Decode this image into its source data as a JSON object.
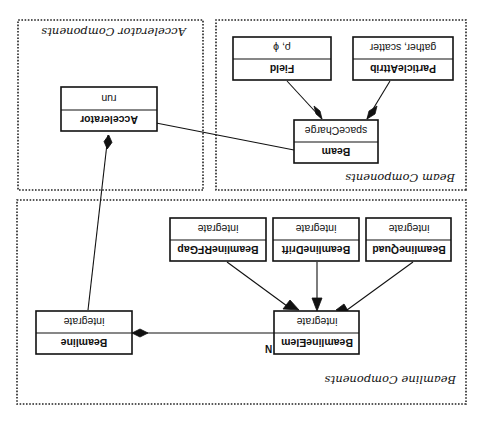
{
  "orientation": "rotated-180",
  "frames": {
    "accelerator": {
      "label": "Accelerator Components"
    },
    "beam": {
      "label": "Beam Components"
    },
    "beamline": {
      "label": "Beamline Components"
    }
  },
  "classes": {
    "accelerator": {
      "name": "Accelerator",
      "operation": "run"
    },
    "beam": {
      "name": "Beam",
      "operation": "spaceCharge"
    },
    "field": {
      "name": "Field",
      "operation": "ρ, ϕ"
    },
    "particle_attrib": {
      "name": "ParticleAttrib",
      "operation": "gather, scatter"
    },
    "beamline": {
      "name": "Beamline",
      "operation": "integrate"
    },
    "beamline_elem": {
      "name": "BeamlineElem",
      "operation": "integrate"
    },
    "beamline_quad": {
      "name": "BeamlineQuad",
      "operation": "integrate"
    },
    "beamline_drift": {
      "name": "BeamlineDrift",
      "operation": "integrate"
    },
    "beamline_rfgap": {
      "name": "BeamlineRFGap",
      "operation": "integrate"
    }
  },
  "relations": [
    {
      "type": "composition",
      "from": "Beam",
      "to": "Accelerator"
    },
    {
      "type": "composition",
      "from": "Beamline",
      "to": "Accelerator"
    },
    {
      "type": "composition",
      "from": "Field",
      "to": "Beam"
    },
    {
      "type": "composition",
      "from": "ParticleAttrib",
      "to": "Beam"
    },
    {
      "type": "composition",
      "from": "BeamlineElem",
      "to": "Beamline",
      "multiplicity": "N"
    },
    {
      "type": "inheritance",
      "from": "BeamlineQuad",
      "to": "BeamlineElem"
    },
    {
      "type": "inheritance",
      "from": "BeamlineDrift",
      "to": "BeamlineElem"
    },
    {
      "type": "inheritance",
      "from": "BeamlineRFGap",
      "to": "BeamlineElem"
    }
  ],
  "multiplicity_label": "N",
  "colors": {
    "stroke": "#111111",
    "background": "#ffffff"
  }
}
